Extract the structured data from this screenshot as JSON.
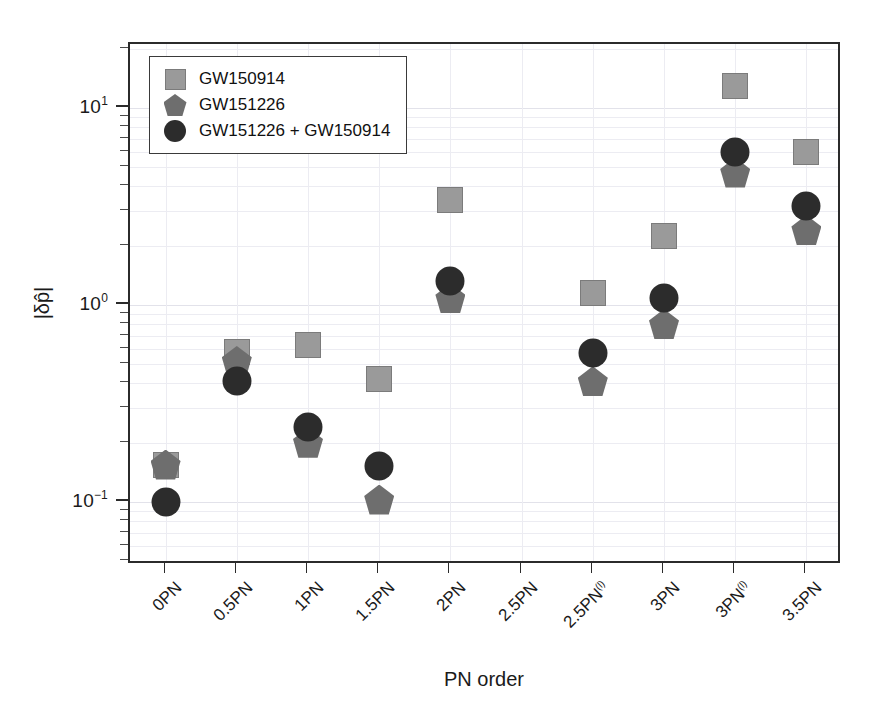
{
  "chart_data": {
    "type": "scatter",
    "title": "",
    "xlabel": "PN order",
    "ylabel": "|δp̂|",
    "yscale": "log",
    "ylim": [
      0.06,
      20
    ],
    "ytick_labels": [
      "10¹",
      "10⁰",
      "10⁻¹"
    ],
    "ytick_values": [
      10,
      1,
      0.1
    ],
    "grid": true,
    "legend_position": "upper-left",
    "categories": [
      "0PN",
      "0.5PN",
      "1PN",
      "1.5PN",
      "2PN",
      "2.5PN",
      "2.5PN(l)",
      "3PN",
      "3PN(l)",
      "3.5PN"
    ],
    "category_labels": [
      {
        "base": "0PN",
        "sup": ""
      },
      {
        "base": "0.5PN",
        "sup": ""
      },
      {
        "base": "1PN",
        "sup": ""
      },
      {
        "base": "1.5PN",
        "sup": ""
      },
      {
        "base": "2PN",
        "sup": ""
      },
      {
        "base": "2.5PN",
        "sup": ""
      },
      {
        "base": "2.5PN",
        "sup": "(l)"
      },
      {
        "base": "3PN",
        "sup": ""
      },
      {
        "base": "3PN",
        "sup": "(l)"
      },
      {
        "base": "3.5PN",
        "sup": ""
      }
    ],
    "series": [
      {
        "name": "GW150914",
        "marker": "square",
        "color": "#9a9a9a",
        "values": [
          0.155,
          0.58,
          0.63,
          0.42,
          3.4,
          null,
          1.15,
          2.25,
          13.0,
          6.0
        ]
      },
      {
        "name": "GW151226",
        "marker": "pentagon",
        "color": "#6e6e6e",
        "values": [
          0.155,
          0.52,
          0.2,
          0.103,
          1.08,
          null,
          0.41,
          0.8,
          4.7,
          2.4
        ]
      },
      {
        "name": "GW151226 + GW150914",
        "marker": "circle",
        "color": "#2c2c2c",
        "values": [
          0.1,
          0.41,
          0.24,
          0.152,
          1.33,
          null,
          0.57,
          1.08,
          6.0,
          3.2
        ]
      }
    ]
  },
  "legend": {
    "items": [
      {
        "label": "GW150914",
        "marker": "square"
      },
      {
        "label": "GW151226",
        "marker": "pentagon"
      },
      {
        "label": "GW151226 + GW150914",
        "marker": "circle"
      }
    ]
  },
  "axes": {
    "x_title": "PN order",
    "y_title": "|δp̂|"
  }
}
